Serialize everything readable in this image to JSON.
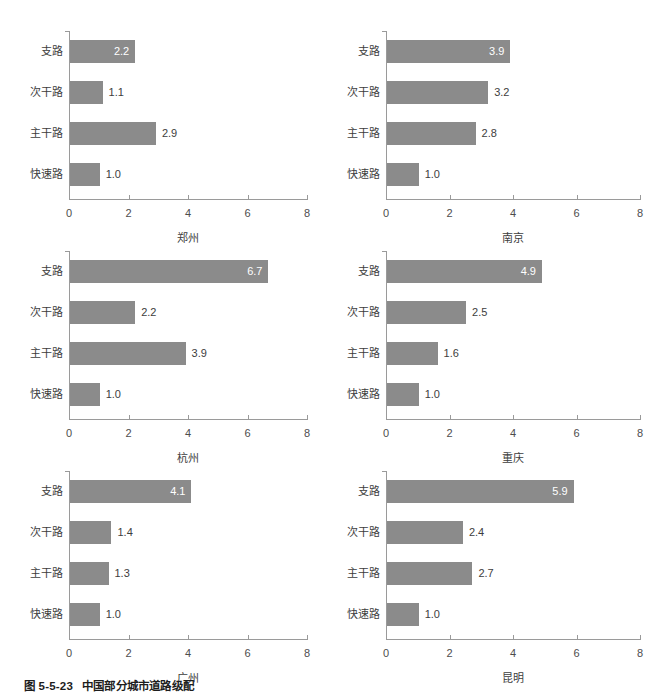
{
  "caption": {
    "number": "图 5-5-23",
    "text": "中国部分城市道路级配"
  },
  "axis": {
    "ticks": [
      "0",
      "2",
      "4",
      "6",
      "8"
    ],
    "tick_values": [
      0,
      2,
      4,
      6,
      8
    ],
    "xmin": 0,
    "xmax": 8
  },
  "categories": [
    "支路",
    "次干路",
    "主干路",
    "快速路"
  ],
  "colors": {
    "bar": "#8b8b8b",
    "axis": "#9a9a9a",
    "label_inside": "#ffffff",
    "label_outside": "#3d3d3d",
    "caption": "#1d1d1d",
    "background": "#ffffff"
  },
  "chart_data": {
    "type": "bar",
    "title": "中国部分城市道路级配",
    "xlabel": "",
    "ylabel": "",
    "xlim": [
      0,
      8
    ],
    "grid": false,
    "legend": "none",
    "orientation": "horizontal",
    "categories": [
      "支路",
      "次干路",
      "主干路",
      "快速路"
    ],
    "panels": [
      {
        "city": "郑州",
        "values": [
          2.2,
          1.1,
          2.9,
          1.0
        ],
        "labels": [
          "2.2",
          "1.1",
          "2.9",
          "1.0"
        ],
        "label_inside": [
          true,
          false,
          false,
          false
        ]
      },
      {
        "city": "南京",
        "values": [
          3.9,
          3.2,
          2.8,
          1.0
        ],
        "labels": [
          "3.9",
          "3.2",
          "2.8",
          "1.0"
        ],
        "label_inside": [
          true,
          false,
          false,
          false
        ]
      },
      {
        "city": "杭州",
        "values": [
          6.7,
          2.2,
          3.9,
          1.0
        ],
        "labels": [
          "6.7",
          "2.2",
          "3.9",
          "1.0"
        ],
        "label_inside": [
          true,
          false,
          false,
          false
        ]
      },
      {
        "city": "重庆",
        "values": [
          4.9,
          2.5,
          1.6,
          1.0
        ],
        "labels": [
          "4.9",
          "2.5",
          "1.6",
          "1.0"
        ],
        "label_inside": [
          true,
          false,
          false,
          false
        ]
      },
      {
        "city": "广州",
        "values": [
          4.1,
          1.4,
          1.3,
          1.0
        ],
        "labels": [
          "4.1",
          "1.4",
          "1.3",
          "1.0"
        ],
        "label_inside": [
          true,
          false,
          false,
          false
        ]
      },
      {
        "city": "昆明",
        "values": [
          5.9,
          2.4,
          2.7,
          1.0
        ],
        "labels": [
          "5.9",
          "2.4",
          "2.7",
          "1.0"
        ],
        "label_inside": [
          true,
          false,
          false,
          false
        ]
      }
    ]
  }
}
